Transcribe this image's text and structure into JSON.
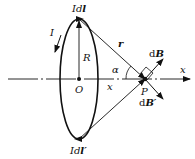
{
  "diagram": {
    "labels": {
      "current_element_top_prefix": "Id",
      "current_element_top_vec": "l",
      "current_element_bottom_prefix": "Id",
      "current_element_bottom_vec": "l′",
      "current": "I",
      "radius": "R",
      "center": "O",
      "distance": "r",
      "angle": "α",
      "axis_x": "x",
      "distance_x": "x",
      "point": "P",
      "field_dB_prefix": "d",
      "field_dB_vec": "B",
      "field_dBp_prefix": "d",
      "field_dBp_vec": "B′"
    }
  }
}
